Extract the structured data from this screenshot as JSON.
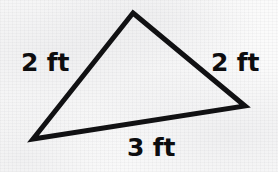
{
  "figure": {
    "shape_name": "triangle",
    "background_color": "#fbfbfb",
    "stroke_color": "#111113",
    "stroke_width": 5,
    "unit": "ft",
    "vertices": [
      {
        "name": "apex",
        "x": 133,
        "y": 13
      },
      {
        "name": "bottom-right",
        "x": 245,
        "y": 106
      },
      {
        "name": "bottom-left",
        "x": 33,
        "y": 139
      }
    ],
    "labels": {
      "left": "2 ft",
      "right": "2 ft",
      "base": "3 ft"
    }
  },
  "chart_data": {
    "type": "diagram",
    "shape": "triangle",
    "unit": "ft",
    "sides": [
      {
        "name": "left",
        "label": "2 ft",
        "value": 2,
        "from": "bottom-left",
        "to": "apex"
      },
      {
        "name": "right",
        "label": "2 ft",
        "value": 2,
        "from": "apex",
        "to": "bottom-right"
      },
      {
        "name": "base",
        "label": "3 ft",
        "value": 3,
        "from": "bottom-left",
        "to": "bottom-right"
      }
    ],
    "values": [
      2,
      2,
      3
    ],
    "categories": [
      "left",
      "right",
      "base"
    ],
    "perimeter": 7
  }
}
